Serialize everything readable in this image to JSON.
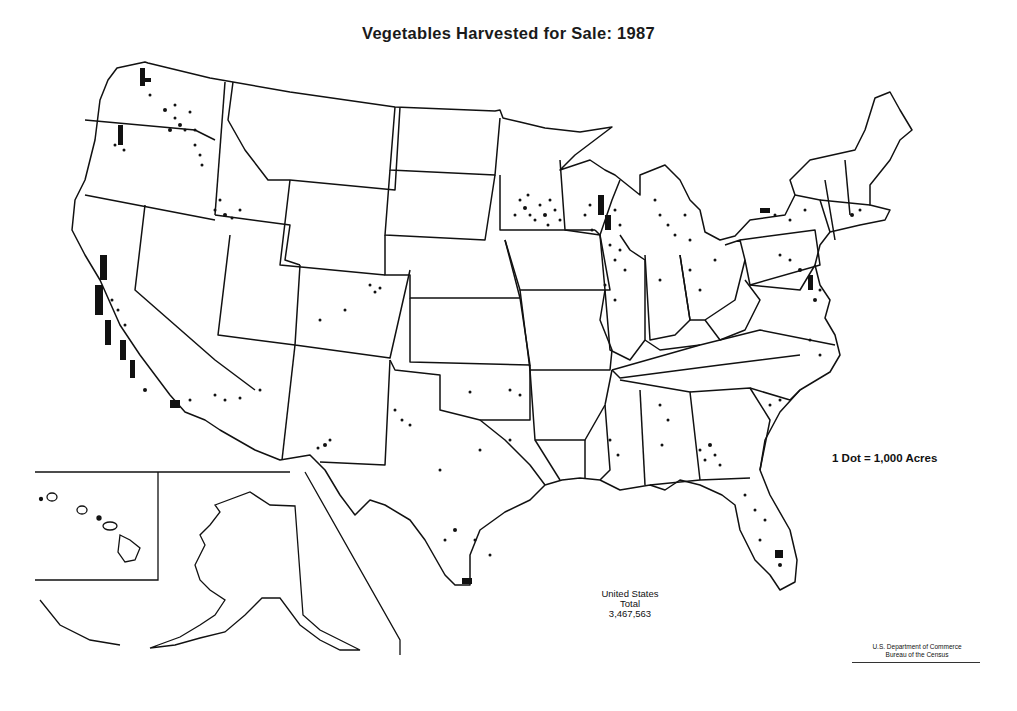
{
  "map": {
    "title": "Vegetables Harvested for Sale: 1987",
    "legend": "1 Dot = 1,000 Acres",
    "total": {
      "line1": "United States",
      "line2": "Total",
      "value": "3,467,563"
    },
    "credit": {
      "line1": "U.S. Department of Commerce",
      "line2": "Bureau of the Census"
    },
    "insets": [
      "Alaska",
      "Hawaii"
    ],
    "colors": {
      "background": "#ffffff",
      "lines": "#111111",
      "dots": "#111111"
    },
    "dense_regions": [
      "Western Washington",
      "Columbia Basin (WA/OR)",
      "Willamette Valley (OR)",
      "Snake River Plain (ID)",
      "Central Valley & coastal California",
      "Imperial Valley / Arizona",
      "San Luis Valley (CO)",
      "Southern Minnesota",
      "Central Wisconsin",
      "Northern Illinois",
      "Michigan",
      "Western New York",
      "Delmarva / New Jersey",
      "South Georgia",
      "Florida",
      "Lower Rio Grande Valley (TX)"
    ]
  }
}
